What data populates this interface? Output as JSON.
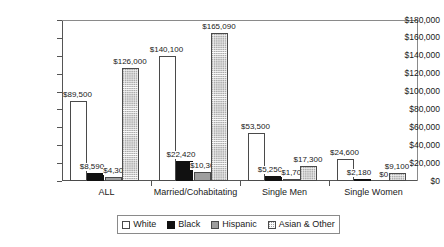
{
  "chart_data": {
    "type": "bar",
    "title": "",
    "xlabel": "",
    "ylabel": "",
    "ylim": [
      0,
      180000
    ],
    "grid": false,
    "legend_position": "bottom",
    "categories": [
      "ALL",
      "Married/Cohabitating",
      "Single Men",
      "Single Women"
    ],
    "ytick_labels": [
      "$0",
      "$20,000",
      "$40,000",
      "$60,000",
      "$80,000",
      "$100,000",
      "$120,000",
      "$140,000",
      "$160,000",
      "$180,000"
    ],
    "ytick_values": [
      0,
      20000,
      40000,
      60000,
      80000,
      100000,
      120000,
      140000,
      160000,
      180000
    ],
    "series": [
      {
        "name": "White",
        "fill": "white",
        "values": [
          89500,
          140100,
          53500,
          24600
        ],
        "data_labels": [
          "$89,500",
          "$140,100",
          "$53,500",
          "$24,600"
        ]
      },
      {
        "name": "Black",
        "fill": "black",
        "values": [
          8590,
          22420,
          5250,
          2180
        ],
        "data_labels": [
          "$8,590",
          "$22,420",
          "$5,250",
          "$2,180"
        ]
      },
      {
        "name": "Hispanic",
        "fill": "hispanic",
        "values": [
          4300,
          10300,
          1700,
          0
        ],
        "data_labels": [
          "$4,300",
          "$10,300",
          "$1,700",
          "$0"
        ]
      },
      {
        "name": "Asian & Other",
        "fill": "asian",
        "values": [
          126000,
          165090,
          17300,
          9100
        ],
        "data_labels": [
          "$126,000",
          "$165,090",
          "$17,300",
          "$9,100"
        ]
      }
    ]
  },
  "legend": {
    "items": [
      {
        "label": "White",
        "fill": "white"
      },
      {
        "label": "Black",
        "fill": "black"
      },
      {
        "label": "Hispanic",
        "fill": "hispanic"
      },
      {
        "label": "Asian & Other",
        "fill": "asian"
      }
    ]
  },
  "colors": {
    "axis": "#555555",
    "bar_outline": "#4a4a4a",
    "white_fill": "#ffffff",
    "black_fill": "#111111",
    "hispanic_fill": "#9e9e9e",
    "asian_fill": "#fbfbfb",
    "text": "#1a1a1a"
  }
}
